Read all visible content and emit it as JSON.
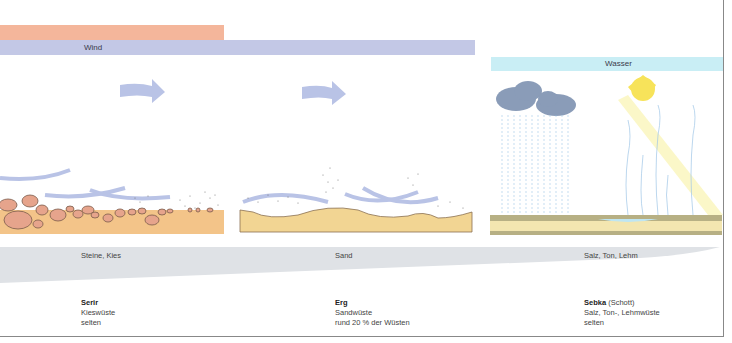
{
  "bars": {
    "heat_bar_color": "#f4b69b",
    "wind": {
      "label": "Wind",
      "color": "#c3c8e6"
    },
    "water": {
      "label": "Wasser",
      "color": "#c9eef5"
    }
  },
  "materials_band": {
    "color": "#dfe2e6",
    "labels": [
      "Steine, Kies",
      "Sand",
      "Salz, Ton, Lehm"
    ]
  },
  "deserts": [
    {
      "name": "Serir",
      "name_extra": "",
      "line1": "Kieswüste",
      "line2": "selten"
    },
    {
      "name": "Erg",
      "name_extra": "",
      "line1": "Sandwüste",
      "line2": "rund 20 % der Wüsten"
    },
    {
      "name": "Sebka",
      "name_extra": "(Schott)",
      "line1": "Salz, Ton-, Lehmwüste",
      "line2": "selten"
    }
  ],
  "colors": {
    "arrow": "#b9c3e6",
    "stone_fill": "#e6a48c",
    "stone_stroke": "#7a5a4a",
    "gravel_ground": "#f3c489",
    "sand_ground": "#f2d593",
    "cloud": "#8a9cb8",
    "sun": "#f7e35a",
    "rain": "#9fc6e6",
    "sebka_ground": "#b7b084"
  }
}
